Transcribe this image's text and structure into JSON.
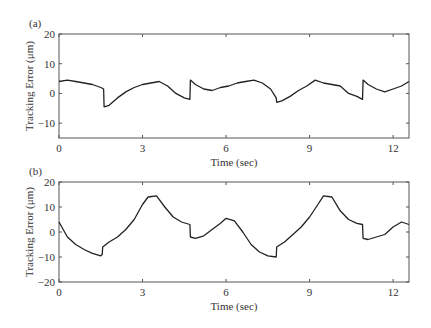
{
  "chart_data": [
    {
      "panel_label": "(a)",
      "type": "line",
      "title": "",
      "xlabel": "Time (sec)",
      "ylabel": "Tracking Error (μm)",
      "xlim": [
        0,
        12.57
      ],
      "ylim": [
        -15,
        20
      ],
      "xticks": [
        0,
        3,
        6,
        9,
        12
      ],
      "yticks": [
        -10,
        0,
        10,
        20
      ],
      "grid": false,
      "series": [
        {
          "name": "tracking error (a)",
          "x": [
            0,
            0.3,
            0.6,
            0.9,
            1.2,
            1.5,
            1.6,
            1.62,
            1.8,
            2.1,
            2.4,
            2.7,
            3.0,
            3.3,
            3.6,
            3.9,
            4.2,
            4.5,
            4.7,
            4.72,
            4.9,
            5.2,
            5.5,
            5.8,
            6.1,
            6.4,
            6.7,
            7.0,
            7.3,
            7.6,
            7.8,
            7.82,
            8.0,
            8.3,
            8.6,
            8.9,
            9.2,
            9.5,
            9.8,
            10.1,
            10.4,
            10.7,
            10.9,
            10.92,
            11.1,
            11.4,
            11.7,
            12.0,
            12.3,
            12.57
          ],
          "y": [
            4,
            4.5,
            4,
            3.5,
            3,
            2,
            1.5,
            -4.5,
            -4,
            -1.5,
            0.5,
            2,
            3,
            3.5,
            4,
            2.5,
            0,
            -1.5,
            -2,
            4.5,
            3,
            1.5,
            1,
            2,
            2.5,
            3.5,
            4,
            4.5,
            3.5,
            1.5,
            -1.5,
            -3,
            -2.5,
            -1,
            1,
            2.5,
            4.5,
            3.5,
            3,
            2.5,
            0,
            -1,
            -2,
            4.5,
            3,
            1.5,
            0.5,
            1.5,
            2.5,
            4
          ]
        }
      ]
    },
    {
      "panel_label": "(b)",
      "type": "line",
      "title": "",
      "xlabel": "Time (sec)",
      "ylabel": "Tracking Error (μm)",
      "xlim": [
        0,
        12.57
      ],
      "ylim": [
        -20,
        20
      ],
      "xticks": [
        0,
        3,
        6,
        9,
        12
      ],
      "yticks": [
        -20,
        -10,
        0,
        10,
        20
      ],
      "grid": false,
      "series": [
        {
          "name": "tracking error (b)",
          "x": [
            0,
            0.3,
            0.6,
            0.9,
            1.2,
            1.5,
            1.55,
            1.57,
            1.8,
            2.1,
            2.4,
            2.7,
            3.0,
            3.2,
            3.5,
            3.8,
            4.1,
            4.4,
            4.7,
            4.72,
            4.9,
            5.2,
            5.5,
            5.8,
            6.0,
            6.3,
            6.6,
            6.9,
            7.2,
            7.5,
            7.8,
            7.82,
            8.1,
            8.4,
            8.7,
            9.0,
            9.3,
            9.5,
            9.8,
            10.1,
            10.4,
            10.7,
            10.9,
            10.92,
            11.1,
            11.4,
            11.7,
            12.0,
            12.3,
            12.57
          ],
          "y": [
            4,
            -2,
            -5,
            -7,
            -8.5,
            -9.5,
            -9,
            -6,
            -4,
            -2,
            1,
            5,
            11,
            14,
            14.5,
            10,
            6,
            4,
            3,
            -2,
            -2.5,
            -1.5,
            1,
            3.5,
            5.5,
            4.5,
            0,
            -5,
            -8,
            -9.5,
            -10,
            -6,
            -4,
            -1,
            2,
            6,
            11,
            14.5,
            14,
            8.5,
            5,
            3.5,
            3,
            -2.5,
            -3,
            -2,
            -1,
            2,
            4,
            3
          ]
        }
      ]
    }
  ],
  "panels": {
    "a": {
      "label": "(a)",
      "xlabel": "Time (sec)",
      "ylabel": "Tracking Error (μm)",
      "yticks": [
        "20",
        "10",
        "0",
        "−10"
      ],
      "xticks": [
        "0",
        "3",
        "6",
        "9",
        "12"
      ]
    },
    "b": {
      "label": "(b)",
      "xlabel": "Time (sec)",
      "ylabel": "Tracking Error (μm)",
      "yticks": [
        "20",
        "10",
        "0",
        "−10",
        "−20"
      ],
      "xticks": [
        "0",
        "3",
        "6",
        "9",
        "12"
      ]
    }
  },
  "colors": {
    "line": "#222222",
    "axis": "#555555",
    "text": "#333333"
  }
}
